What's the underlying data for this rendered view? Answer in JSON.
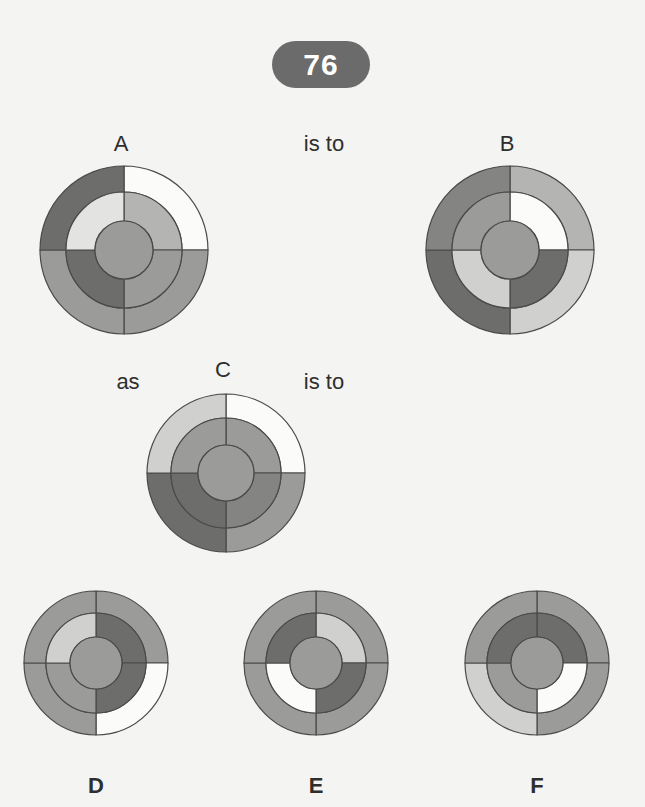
{
  "question": {
    "number": "76",
    "pill_color": "#6b6b6b",
    "pill_text_color": "#ffffff"
  },
  "background_color": "#f4f4f3",
  "connectors": {
    "is_to_1": "is to",
    "as": "as",
    "is_to_2": "is to"
  },
  "palette": {
    "white": "#fbfbfa",
    "very_light": "#e3e3e1",
    "light": "#d0d0ce",
    "medium_light": "#b4b4b2",
    "medium": "#9b9b99",
    "medium_dark": "#848482",
    "dark": "#6d6d6b",
    "very_dark": "#5b5b59",
    "hub": "#9b9b99",
    "stroke": "#4a4a48"
  },
  "figures": [
    {
      "id": "A",
      "label": "A",
      "cx": 124,
      "cy": 250,
      "r_outer": 84,
      "r_inner": 58,
      "r_hub": 29,
      "label_x": 121,
      "label_y": 133,
      "outer": {
        "tl": "#6d6d6b",
        "tr": "#fbfbfa",
        "bl": "#9b9b99",
        "br": "#9b9b99"
      },
      "inner": {
        "tl": "#e3e3e1",
        "tr": "#b4b4b2",
        "bl": "#6d6d6b",
        "br": "#9b9b99"
      },
      "hub": "#9b9b99"
    },
    {
      "id": "B",
      "label": "B",
      "cx": 510,
      "cy": 250,
      "r_outer": 84,
      "r_inner": 58,
      "r_hub": 29,
      "label_x": 507,
      "label_y": 133,
      "outer": {
        "tl": "#848482",
        "tr": "#b4b4b2",
        "bl": "#6d6d6b",
        "br": "#d0d0ce"
      },
      "inner": {
        "tl": "#9b9b99",
        "tr": "#fbfbfa",
        "bl": "#d0d0ce",
        "br": "#6d6d6b"
      },
      "hub": "#9b9b99"
    },
    {
      "id": "C",
      "label": "C",
      "cx": 226,
      "cy": 473,
      "r_outer": 79,
      "r_inner": 55,
      "r_hub": 28,
      "label_x": 223,
      "label_y": 359,
      "outer": {
        "tl": "#d0d0ce",
        "tr": "#fbfbfa",
        "bl": "#6d6d6b",
        "br": "#9b9b99"
      },
      "inner": {
        "tl": "#9b9b99",
        "tr": "#9b9b99",
        "bl": "#6d6d6b",
        "br": "#848482"
      },
      "hub": "#9b9b99"
    },
    {
      "id": "D",
      "label": "D",
      "cx": 96,
      "cy": 663,
      "r_outer": 72,
      "r_inner": 50,
      "r_hub": 26,
      "label_x": 96,
      "label_y": 775,
      "outer": {
        "tl": "#9b9b99",
        "tr": "#9b9b99",
        "bl": "#9b9b99",
        "br": "#fbfbfa"
      },
      "inner": {
        "tl": "#d0d0ce",
        "tr": "#6d6d6b",
        "bl": "#9b9b99",
        "br": "#6d6d6b"
      },
      "hub": "#9b9b99"
    },
    {
      "id": "E",
      "label": "E",
      "cx": 316,
      "cy": 663,
      "r_outer": 72,
      "r_inner": 50,
      "r_hub": 26,
      "label_x": 316,
      "label_y": 775,
      "outer": {
        "tl": "#9b9b99",
        "tr": "#9b9b99",
        "bl": "#9b9b99",
        "br": "#9b9b99"
      },
      "inner": {
        "tl": "#6d6d6b",
        "tr": "#d0d0ce",
        "bl": "#fbfbfa",
        "br": "#6d6d6b"
      },
      "hub": "#9b9b99"
    },
    {
      "id": "F",
      "label": "F",
      "cx": 537,
      "cy": 663,
      "r_outer": 72,
      "r_inner": 50,
      "r_hub": 26,
      "label_x": 537,
      "label_y": 775,
      "outer": {
        "tl": "#9b9b99",
        "tr": "#9b9b99",
        "bl": "#d0d0ce",
        "br": "#9b9b99"
      },
      "inner": {
        "tl": "#6d6d6b",
        "tr": "#6d6d6b",
        "bl": "#9b9b99",
        "br": "#fbfbfa"
      },
      "hub": "#9b9b99"
    }
  ],
  "connector_positions": {
    "is_to_1": {
      "x": 324,
      "y": 133
    },
    "as": {
      "x": 128,
      "y": 371
    },
    "is_to_2": {
      "x": 324,
      "y": 371
    }
  }
}
